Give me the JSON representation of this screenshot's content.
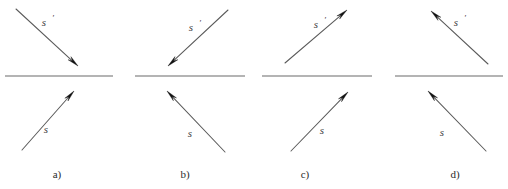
{
  "figure": {
    "type": "optics-ray-diagram",
    "background_color": "#ffffff",
    "interface_color": "#6b6b6b",
    "ray_color": "#5a5a5a",
    "arrow_color": "#111111",
    "label_color": "#3c3c3c",
    "panel_label_color": "#2b2b2b",
    "canvas": {
      "width": 508,
      "height": 189
    }
  },
  "panels": [
    {
      "id": "panel-a",
      "label": "a)",
      "label_x": 57,
      "label_y": 178,
      "interface": {
        "x1": 5,
        "y1": 76,
        "x2": 113,
        "y2": 76
      },
      "rays": [
        {
          "name": "s-prime",
          "label": "s",
          "prime": "′",
          "label_x": 44,
          "label_y": 26,
          "prime_x": 53,
          "prime_y": 21,
          "x1": 16,
          "y1": 9,
          "x2": 78,
          "y2": 66,
          "arrow_at": "end",
          "direction": "down-right",
          "side": "upper"
        },
        {
          "name": "s-incident",
          "label": "s",
          "prime": "",
          "label_x": 46,
          "label_y": 133,
          "prime_x": 0,
          "prime_y": 0,
          "x1": 22,
          "y1": 150,
          "x2": 74,
          "y2": 91,
          "arrow_at": "end",
          "direction": "up-right",
          "side": "lower"
        }
      ]
    },
    {
      "id": "panel-b",
      "label": "b)",
      "label_x": 185,
      "label_y": 178,
      "interface": {
        "x1": 135,
        "y1": 76,
        "x2": 245,
        "y2": 76
      },
      "rays": [
        {
          "name": "s-prime",
          "label": "s",
          "prime": "′",
          "label_x": 191,
          "label_y": 31,
          "prime_x": 200,
          "prime_y": 26,
          "x1": 228,
          "y1": 10,
          "x2": 168,
          "y2": 66,
          "arrow_at": "end",
          "direction": "down-left",
          "side": "upper"
        },
        {
          "name": "s-incident",
          "label": "s",
          "prime": "",
          "label_x": 190,
          "label_y": 137,
          "prime_x": 0,
          "prime_y": 0,
          "x1": 225,
          "y1": 152,
          "x2": 167,
          "y2": 91,
          "arrow_at": "end",
          "direction": "up-left",
          "side": "lower"
        }
      ]
    },
    {
      "id": "panel-c",
      "label": "c)",
      "label_x": 305,
      "label_y": 178,
      "interface": {
        "x1": 262,
        "y1": 76,
        "x2": 372,
        "y2": 76
      },
      "rays": [
        {
          "name": "s-prime",
          "label": "s",
          "prime": "′",
          "label_x": 316,
          "label_y": 28,
          "prime_x": 325,
          "prime_y": 23,
          "x1": 285,
          "y1": 63,
          "x2": 347,
          "y2": 10,
          "arrow_at": "end",
          "direction": "up-right",
          "side": "upper"
        },
        {
          "name": "s-incident",
          "label": "s",
          "prime": "",
          "label_x": 322,
          "label_y": 134,
          "prime_x": 0,
          "prime_y": 0,
          "x1": 291,
          "y1": 151,
          "x2": 348,
          "y2": 92,
          "arrow_at": "end",
          "direction": "up-right",
          "side": "lower"
        }
      ]
    },
    {
      "id": "panel-d",
      "label": "d)",
      "label_x": 455,
      "label_y": 178,
      "interface": {
        "x1": 395,
        "y1": 76,
        "x2": 503,
        "y2": 76
      },
      "rays": [
        {
          "name": "s-prime",
          "label": "s",
          "prime": "′",
          "label_x": 456,
          "label_y": 26,
          "prime_x": 465,
          "prime_y": 21,
          "x1": 488,
          "y1": 64,
          "x2": 431,
          "y2": 11,
          "arrow_at": "end",
          "direction": "up-left",
          "side": "upper"
        },
        {
          "name": "s-incident",
          "label": "s",
          "prime": "",
          "label_x": 442,
          "label_y": 136,
          "prime_x": 0,
          "prime_y": 0,
          "x1": 486,
          "y1": 151,
          "x2": 428,
          "y2": 91,
          "arrow_at": "end",
          "direction": "up-left",
          "side": "lower"
        }
      ]
    }
  ]
}
